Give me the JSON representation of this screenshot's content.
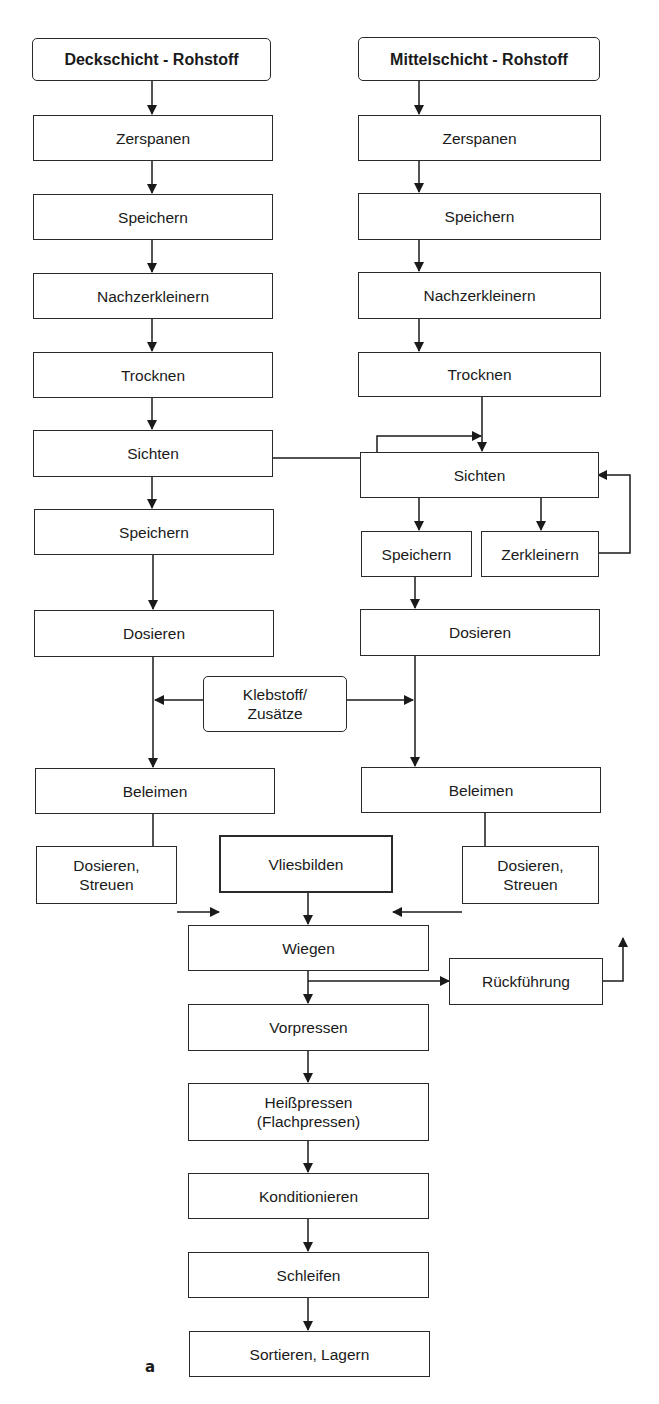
{
  "diagram": {
    "type": "process-flowchart",
    "figure_label": "a",
    "left_column": {
      "source": "Deckschicht - Rohstoff",
      "steps": [
        "Zerspanen",
        "Speichern",
        "Nachzerkleinern",
        "Trocknen",
        "Sichten",
        "Speichern",
        "Dosieren",
        "Beleimen",
        "Dosieren,\nStreuen"
      ]
    },
    "right_column": {
      "source": "Mittelschicht - Rohstoff",
      "steps": [
        "Zerspanen",
        "Speichern",
        "Nachzerkleinern",
        "Trocknen",
        "Sichten",
        "Speichern",
        "Zerkleinern",
        "Dosieren",
        "Beleimen",
        "Dosieren,\nStreuen"
      ]
    },
    "shared": {
      "additives": "Klebstoff/\nZusätze",
      "steps": [
        "Vliesbilden",
        "Wiegen",
        "Rückführung",
        "Vorpressen",
        "Heißpressen\n(Flachpressen)",
        "Konditionieren",
        "Schleifen",
        "Sortieren, Lagern"
      ]
    },
    "colors": {
      "line": "#1a1a1a",
      "background": "#ffffff"
    }
  }
}
